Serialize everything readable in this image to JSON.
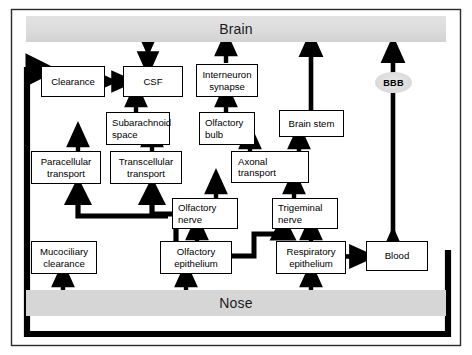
{
  "figure": {
    "type": "flow-diagram",
    "frame": {
      "border_color": "#000000"
    },
    "bands": [
      {
        "id": "brain",
        "label": "Brain",
        "color": "#dcdcdc"
      },
      {
        "id": "nose",
        "label": "Nose",
        "color": "#d6d6d6"
      }
    ],
    "nodes": [
      {
        "id": "clearance",
        "label": "Clearance",
        "lines": [
          "Clearance"
        ]
      },
      {
        "id": "csf",
        "label": "CSF",
        "lines": [
          "CSF"
        ]
      },
      {
        "id": "interneuron-synapse",
        "label": "Interneuron synapse",
        "lines": [
          "Interneuron",
          "synapse"
        ]
      },
      {
        "id": "subarachnoid-space",
        "label": "Subarachnoid space",
        "lines": [
          "Subarachnoid",
          "space"
        ]
      },
      {
        "id": "olfactory-bulb",
        "label": "Olfactory bulb",
        "lines": [
          "Olfactory",
          "bulb"
        ]
      },
      {
        "id": "brain-stem",
        "label": "Brain stem",
        "lines": [
          "Brain stem"
        ]
      },
      {
        "id": "paracellular-transport",
        "label": "Paracellular transport",
        "lines": [
          "Paracellular",
          "transport"
        ]
      },
      {
        "id": "transcellular-transport",
        "label": "Transcellular transport",
        "lines": [
          "Transcellular",
          "transport"
        ]
      },
      {
        "id": "axonal-transport",
        "label": "Axonal transport",
        "lines": [
          "Axonal",
          "transport"
        ]
      },
      {
        "id": "olfactory-nerve",
        "label": "Olfactory nerve",
        "lines": [
          "Olfactory",
          "nerve"
        ]
      },
      {
        "id": "trigeminal-nerve",
        "label": "Trigeminal nerve",
        "lines": [
          "Trigeminal",
          "nerve"
        ]
      },
      {
        "id": "mucociliary-clearance",
        "label": "Mucociliary clearance",
        "lines": [
          "Mucociliary",
          "clearance"
        ]
      },
      {
        "id": "olfactory-epithelium",
        "label": "Olfactory epithelium",
        "lines": [
          "Olfactory",
          "epithelium"
        ]
      },
      {
        "id": "respiratory-epithelium",
        "label": "Respiratory epithelium",
        "lines": [
          "Respiratory",
          "epithelium"
        ]
      },
      {
        "id": "blood",
        "label": "Blood",
        "lines": [
          "Blood"
        ]
      }
    ],
    "oval_nodes": [
      {
        "id": "bbb",
        "label": "BBB"
      }
    ],
    "edges": [
      {
        "from": "csf",
        "to": "brain",
        "direction": "bidirectional"
      },
      {
        "from": "clearance",
        "to": "csf",
        "direction": "bidirectional"
      },
      {
        "from": "subarachnoid-space",
        "to": "csf",
        "direction": "forward"
      },
      {
        "from": "paracellular-transport",
        "to": "subarachnoid-space",
        "direction": "forward"
      },
      {
        "from": "transcellular-transport",
        "to": "subarachnoid-space",
        "direction": "forward"
      },
      {
        "from": "olfactory-epithelium",
        "to": "paracellular-transport",
        "direction": "forward"
      },
      {
        "from": "olfactory-epithelium",
        "to": "transcellular-transport",
        "direction": "forward"
      },
      {
        "from": "interneuron-synapse",
        "to": "brain",
        "direction": "forward"
      },
      {
        "from": "olfactory-bulb",
        "to": "interneuron-synapse",
        "direction": "forward"
      },
      {
        "from": "axonal-transport",
        "to": "olfactory-bulb",
        "direction": "forward"
      },
      {
        "from": "axonal-transport",
        "to": "brain-stem",
        "direction": "forward"
      },
      {
        "from": "brain-stem",
        "to": "brain",
        "direction": "forward"
      },
      {
        "from": "olfactory-nerve",
        "to": "axonal-transport",
        "direction": "forward"
      },
      {
        "from": "trigeminal-nerve",
        "to": "axonal-transport",
        "direction": "forward"
      },
      {
        "from": "olfactory-epithelium",
        "to": "olfactory-nerve",
        "direction": "forward"
      },
      {
        "from": "olfactory-epithelium",
        "to": "trigeminal-nerve",
        "direction": "forward"
      },
      {
        "from": "respiratory-epithelium",
        "to": "trigeminal-nerve",
        "direction": "forward"
      },
      {
        "from": "nose",
        "to": "mucociliary-clearance",
        "direction": "forward"
      },
      {
        "from": "nose",
        "to": "olfactory-epithelium",
        "direction": "forward"
      },
      {
        "from": "nose",
        "to": "respiratory-epithelium",
        "direction": "forward"
      },
      {
        "from": "respiratory-epithelium",
        "to": "blood",
        "direction": "forward"
      },
      {
        "from": "blood",
        "to": "bbb",
        "direction": "bidirectional"
      },
      {
        "from": "bbb",
        "to": "brain",
        "direction": "forward"
      },
      {
        "from": "blood",
        "to": "clearance",
        "direction": "forward",
        "routing": "loop-around-bottom-left"
      }
    ]
  }
}
